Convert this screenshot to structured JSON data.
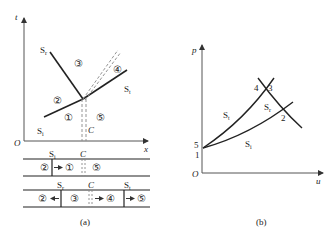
{
  "figure": {
    "panel_a": {
      "caption": "(a)",
      "axes": {
        "x_label": "x",
        "y_label": "t",
        "origin_label": "O"
      },
      "wave_labels": {
        "rarefaction": {
          "main": "S",
          "sub": "r"
        },
        "transmitted": {
          "main": "S",
          "sub": "t"
        },
        "incident": {
          "main": "S",
          "sub": "i"
        },
        "contact": "C"
      },
      "regions": [
        "①",
        "②",
        "③",
        "④",
        "⑤"
      ],
      "tube_before": {
        "labels": {
          "shock": "S",
          "shock_sub": "i",
          "contact": "C"
        },
        "regions": [
          "②",
          "①",
          "⑤"
        ]
      },
      "tube_after": {
        "labels": {
          "rarefaction": "S",
          "rarefaction_sub": "r",
          "contact": "C",
          "transmitted": "S",
          "transmitted_sub": "t"
        },
        "regions": [
          "②",
          "③",
          "④",
          "⑤"
        ]
      }
    },
    "panel_b": {
      "caption": "(b)",
      "axes": {
        "x_label": "u",
        "y_label": "p",
        "origin_label": "O"
      },
      "curve_labels": {
        "transmitted": {
          "main": "S",
          "sub": "t"
        },
        "rarefaction": {
          "main": "S",
          "sub": "r"
        },
        "incident": {
          "main": "S",
          "sub": "i"
        }
      },
      "point_labels": {
        "p1": "1",
        "p2": "2",
        "p3": "3",
        "p4": "4",
        "p5": "5"
      }
    },
    "colors": {
      "line": "#222222",
      "axis": "#555555",
      "dashed": "#888888"
    }
  }
}
